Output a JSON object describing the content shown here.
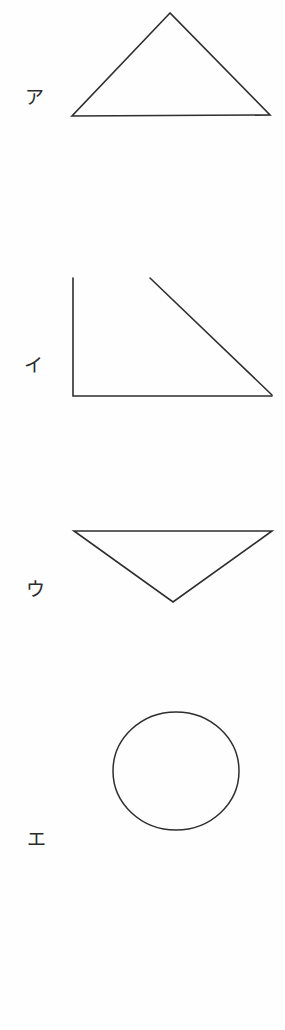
{
  "document": {
    "title": "Shapes Worksheet",
    "kind": "scanned-worksheet",
    "background_color": "#fefefe",
    "ink_color": "#2e2e2e",
    "width": 285,
    "height": 1030
  },
  "figures": [
    {
      "label": "ア",
      "label_romaji": "a",
      "shape_name": "upward-triangle",
      "description": "Upward pointing triangle (isosceles, wide base)",
      "label_position": {
        "x": 25,
        "y": 88
      },
      "points": "170,13 72,116 270,115"
    },
    {
      "label": "イ",
      "label_romaji": "i",
      "shape_name": "right-triangle",
      "description": "Right triangle with vertical left leg and horizontal bottom leg",
      "label_position": {
        "x": 24,
        "y": 356
      },
      "vertical_leg": "73,278 73,396",
      "horizontal_leg": "73,396 272,396",
      "hypotenuse": "150,278 272,395"
    },
    {
      "label": "ウ",
      "label_romaji": "u",
      "shape_name": "downward-triangle",
      "description": "Downward pointing triangle (inverted, wide top edge)",
      "label_position": {
        "x": 26,
        "y": 580
      },
      "points": "74,531 272,531 173,602"
    },
    {
      "label": "エ",
      "label_romaji": "e",
      "shape_name": "circle",
      "description": "Hand drawn circle",
      "label_position": {
        "x": 27,
        "y": 830
      },
      "center": {
        "x": 176,
        "y": 771
      },
      "radius_x": 63,
      "radius_y": 59
    }
  ]
}
